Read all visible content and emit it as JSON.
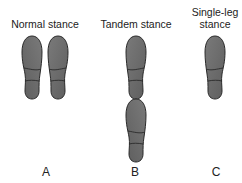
{
  "figure": {
    "panels": [
      {
        "id": "A",
        "title_lines": [
          "Normal stance"
        ],
        "letter": "A",
        "feet": 2,
        "arrangement": "side-by-side"
      },
      {
        "id": "B",
        "title_lines": [
          "Tandem stance"
        ],
        "letter": "B",
        "feet": 2,
        "arrangement": "heel-to-toe"
      },
      {
        "id": "C",
        "title_lines": [
          "Single-leg",
          "stance"
        ],
        "letter": "C",
        "feet": 1,
        "arrangement": "single"
      }
    ],
    "colors": {
      "foot_fill": "#6b6b6b",
      "foot_outline": "#2a2a2a",
      "text": "#222222",
      "background": "#ffffff"
    }
  }
}
